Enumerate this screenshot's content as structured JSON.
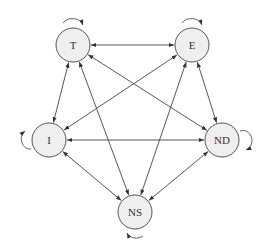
{
  "diagram": {
    "type": "directed-graph",
    "style": {
      "node_fill": "#efefef",
      "node_stroke": "#555555",
      "edge_color": "#444444"
    },
    "nodes": [
      {
        "id": "T",
        "label": "T",
        "x": 73,
        "y": 45,
        "r": 17,
        "self_loop": "top"
      },
      {
        "id": "E",
        "label": "E",
        "x": 192,
        "y": 45,
        "r": 17,
        "self_loop": "top"
      },
      {
        "id": "I",
        "label": "I",
        "x": 49,
        "y": 140,
        "r": 17,
        "self_loop": "left"
      },
      {
        "id": "ND",
        "label": "ND",
        "x": 222,
        "y": 140,
        "r": 17,
        "self_loop": "right"
      },
      {
        "id": "NS",
        "label": "NS",
        "x": 135,
        "y": 212,
        "r": 17,
        "self_loop": "bottom"
      }
    ],
    "edges": [
      {
        "from": "T",
        "to": "E",
        "bidirectional": true
      },
      {
        "from": "T",
        "to": "I",
        "bidirectional": true
      },
      {
        "from": "T",
        "to": "ND",
        "bidirectional": true
      },
      {
        "from": "T",
        "to": "NS",
        "bidirectional": true
      },
      {
        "from": "E",
        "to": "I",
        "bidirectional": true
      },
      {
        "from": "E",
        "to": "ND",
        "bidirectional": true
      },
      {
        "from": "E",
        "to": "NS",
        "bidirectional": true
      },
      {
        "from": "I",
        "to": "ND",
        "bidirectional": true
      },
      {
        "from": "I",
        "to": "NS",
        "bidirectional": true
      },
      {
        "from": "ND",
        "to": "NS",
        "bidirectional": true
      }
    ]
  }
}
